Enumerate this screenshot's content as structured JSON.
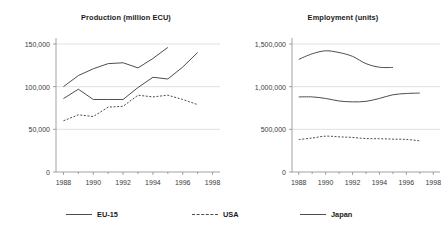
{
  "legend": {
    "items": [
      {
        "name": "EU-15",
        "style": "solid"
      },
      {
        "name": "USA",
        "style": "dashed"
      },
      {
        "name": "Japan",
        "style": "solid"
      }
    ]
  },
  "colors": {
    "line": "#4d4d4d",
    "grid": "#d9d9d9",
    "axis": "#8c8c8c",
    "text": "#1a1a1a",
    "background": "#ffffff"
  },
  "chart_data": [
    {
      "type": "line",
      "title": "Production (million ECU)",
      "xlabel": "",
      "ylabel": "",
      "xlim": [
        1987.5,
        1998.5
      ],
      "ylim": [
        0,
        150000
      ],
      "xticks": [
        1988,
        1990,
        1992,
        1994,
        1996,
        1998
      ],
      "xticklabels": [
        "1988",
        "1990",
        "1992",
        "1994",
        "1996",
        "1998"
      ],
      "yticks": [
        0,
        50000,
        100000,
        150000
      ],
      "yticklabels": [
        "0",
        "50,000",
        "100,000",
        "150,000"
      ],
      "grid": "horizontal",
      "legend_position": "bottom",
      "series": [
        {
          "name": "EU-15",
          "style": "solid",
          "x": [
            1988,
            1989,
            1990,
            1991,
            1992,
            1993,
            1994,
            1995
          ],
          "values": [
            100000,
            113000,
            121000,
            127000,
            128000,
            122000,
            133000,
            146000
          ]
        },
        {
          "name": "USA",
          "style": "dashed",
          "x": [
            1988,
            1989,
            1990,
            1991,
            1992,
            1993,
            1994,
            1995,
            1996,
            1997
          ],
          "values": [
            60000,
            67000,
            65000,
            76000,
            77000,
            90000,
            88000,
            90000,
            85000,
            79000
          ]
        },
        {
          "name": "Japan",
          "style": "solid",
          "x": [
            1988,
            1989,
            1990,
            1991,
            1992,
            1993,
            1994,
            1995,
            1996,
            1997
          ],
          "values": [
            86000,
            97000,
            85000,
            85000,
            85000,
            99000,
            111000,
            109000,
            123000,
            140000
          ]
        }
      ]
    },
    {
      "type": "line",
      "title": "Employment (units)",
      "xlabel": "",
      "ylabel": "",
      "xlim": [
        1987.5,
        1998.5
      ],
      "ylim": [
        0,
        1500000
      ],
      "xticks": [
        1988,
        1990,
        1992,
        1994,
        1996,
        1998
      ],
      "xticklabels": [
        "1988",
        "1990",
        "1992",
        "1994",
        "1996",
        "1998"
      ],
      "yticks": [
        0,
        500000,
        1000000,
        1500000
      ],
      "yticklabels": [
        "0",
        "500,000",
        "1,000,000",
        "1,500,000"
      ],
      "grid": "horizontal",
      "legend_position": "bottom",
      "series": [
        {
          "name": "Japan",
          "style": "solid",
          "x": [
            1988,
            1989,
            1990,
            1991,
            1992,
            1993,
            1994,
            1995
          ],
          "values": [
            1320000,
            1385000,
            1420000,
            1400000,
            1355000,
            1270000,
            1228000,
            1225000
          ]
        },
        {
          "name": "EU-15",
          "style": "solid",
          "x": [
            1988,
            1989,
            1990,
            1991,
            1992,
            1993,
            1994,
            1995,
            1996,
            1997
          ],
          "values": [
            880000,
            880000,
            862000,
            832000,
            822000,
            828000,
            862000,
            905000,
            920000,
            925000
          ]
        },
        {
          "name": "USA",
          "style": "dashed",
          "x": [
            1988,
            1989,
            1990,
            1991,
            1992,
            1993,
            1994,
            1995,
            1996,
            1997
          ],
          "values": [
            380000,
            398000,
            420000,
            412000,
            405000,
            392000,
            390000,
            385000,
            382000,
            365000
          ]
        }
      ]
    }
  ]
}
